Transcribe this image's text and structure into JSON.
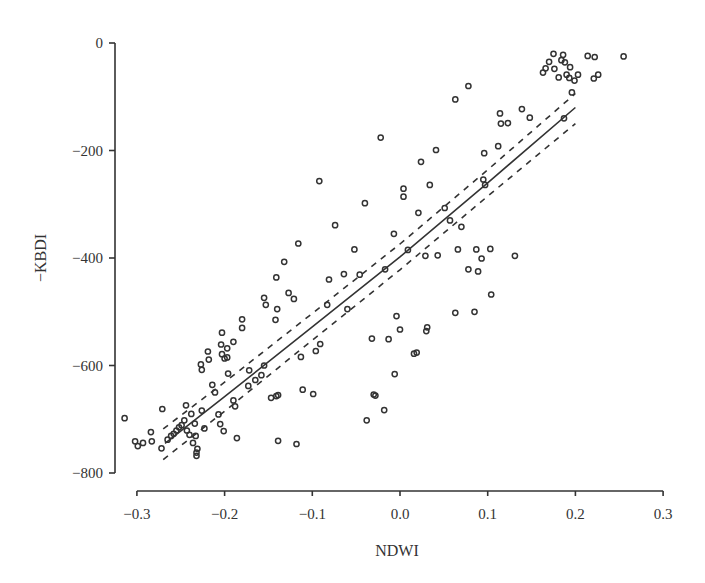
{
  "chart_data": {
    "type": "scatter",
    "title": "",
    "xlabel": "NDWI",
    "ylabel": "−KBDI",
    "xlim": [
      -0.3,
      0.3
    ],
    "ylim": [
      -800,
      0
    ],
    "xticks": [
      "−0.3",
      "−0.2",
      "−0.1",
      "0.0",
      "0.1",
      "0.2",
      "0.3"
    ],
    "xtick_values": [
      -0.3,
      -0.2,
      -0.1,
      0.0,
      0.1,
      0.2,
      0.3
    ],
    "yticks": [
      "0",
      "−200",
      "−400",
      "−600",
      "−800"
    ],
    "ytick_values": [
      0,
      -200,
      -400,
      -600,
      -800
    ],
    "grid": false,
    "legend": null,
    "series": [
      {
        "name": "observations",
        "marker": "open-circle",
        "points": [
          [
            -0.314,
            -698
          ],
          [
            -0.302,
            -741
          ],
          [
            -0.299,
            -750
          ],
          [
            -0.293,
            -744
          ],
          [
            -0.284,
            -724
          ],
          [
            -0.283,
            -741
          ],
          [
            -0.271,
            -681
          ],
          [
            -0.272,
            -754
          ],
          [
            -0.265,
            -738
          ],
          [
            -0.261,
            -731
          ],
          [
            -0.258,
            -727
          ],
          [
            -0.255,
            -721
          ],
          [
            -0.252,
            -715
          ],
          [
            -0.249,
            -711
          ],
          [
            -0.246,
            -702
          ],
          [
            -0.244,
            -674
          ],
          [
            -0.243,
            -721
          ],
          [
            -0.24,
            -729
          ],
          [
            -0.238,
            -690
          ],
          [
            -0.236,
            -744
          ],
          [
            -0.234,
            -708
          ],
          [
            -0.233,
            -731
          ],
          [
            -0.232,
            -762
          ],
          [
            -0.232,
            -768
          ],
          [
            -0.231,
            -755
          ],
          [
            -0.226,
            -684
          ],
          [
            -0.223,
            -717
          ],
          [
            -0.227,
            -598
          ],
          [
            -0.226,
            -608
          ],
          [
            -0.219,
            -574
          ],
          [
            -0.218,
            -589
          ],
          [
            -0.214,
            -636
          ],
          [
            -0.211,
            -650
          ],
          [
            -0.207,
            -691
          ],
          [
            -0.205,
            -709
          ],
          [
            -0.201,
            -722
          ],
          [
            -0.203,
            -539
          ],
          [
            -0.204,
            -561
          ],
          [
            -0.203,
            -579
          ],
          [
            -0.2,
            -587
          ],
          [
            -0.197,
            -568
          ],
          [
            -0.197,
            -585
          ],
          [
            -0.196,
            -615
          ],
          [
            -0.19,
            -556
          ],
          [
            -0.19,
            -665
          ],
          [
            -0.188,
            -676
          ],
          [
            -0.186,
            -735
          ],
          [
            -0.18,
            -514
          ],
          [
            -0.18,
            -530
          ],
          [
            -0.173,
            -638
          ],
          [
            -0.172,
            -609
          ],
          [
            -0.165,
            -627
          ],
          [
            -0.158,
            -618
          ],
          [
            -0.155,
            -600
          ],
          [
            -0.153,
            -487
          ],
          [
            -0.155,
            -474
          ],
          [
            -0.147,
            -660
          ],
          [
            -0.141,
            -657
          ],
          [
            -0.139,
            -655
          ],
          [
            -0.141,
            -436
          ],
          [
            -0.14,
            -495
          ],
          [
            -0.142,
            -515
          ],
          [
            -0.139,
            -740
          ],
          [
            -0.132,
            -407
          ],
          [
            -0.127,
            -465
          ],
          [
            -0.121,
            -476
          ],
          [
            -0.118,
            -746
          ],
          [
            -0.116,
            -373
          ],
          [
            -0.113,
            -584
          ],
          [
            -0.111,
            -645
          ],
          [
            -0.099,
            -653
          ],
          [
            -0.096,
            -573
          ],
          [
            -0.092,
            -257
          ],
          [
            -0.091,
            -560
          ],
          [
            -0.083,
            -487
          ],
          [
            -0.081,
            -440
          ],
          [
            -0.074,
            -339
          ],
          [
            -0.064,
            -430
          ],
          [
            -0.06,
            -495
          ],
          [
            -0.052,
            -384
          ],
          [
            -0.046,
            -431
          ],
          [
            -0.04,
            -298
          ],
          [
            -0.038,
            -702
          ],
          [
            -0.032,
            -550
          ],
          [
            -0.03,
            -654
          ],
          [
            -0.028,
            -656
          ],
          [
            -0.022,
            -176
          ],
          [
            -0.018,
            -683
          ],
          [
            -0.017,
            -421
          ],
          [
            -0.013,
            -551
          ],
          [
            -0.007,
            -355
          ],
          [
            -0.006,
            -616
          ],
          [
            -0.004,
            -508
          ],
          [
            0.0,
            -533
          ],
          [
            0.004,
            -271
          ],
          [
            0.004,
            -286
          ],
          [
            0.009,
            -385
          ],
          [
            0.016,
            -578
          ],
          [
            0.019,
            -576
          ],
          [
            0.021,
            -316
          ],
          [
            0.024,
            -221
          ],
          [
            0.029,
            -396
          ],
          [
            0.03,
            -536
          ],
          [
            0.031,
            -529
          ],
          [
            0.034,
            -264
          ],
          [
            0.041,
            -199
          ],
          [
            0.043,
            -395
          ],
          [
            0.051,
            -307
          ],
          [
            0.057,
            -330
          ],
          [
            0.063,
            -105
          ],
          [
            0.063,
            -502
          ],
          [
            0.066,
            -384
          ],
          [
            0.07,
            -342
          ],
          [
            0.078,
            -80
          ],
          [
            0.078,
            -421
          ],
          [
            0.085,
            -500
          ],
          [
            0.087,
            -384
          ],
          [
            0.089,
            -425
          ],
          [
            0.093,
            -401
          ],
          [
            0.095,
            -254
          ],
          [
            0.096,
            -205
          ],
          [
            0.097,
            -264
          ],
          [
            0.103,
            -383
          ],
          [
            0.104,
            -468
          ],
          [
            0.112,
            -192
          ],
          [
            0.114,
            -131
          ],
          [
            0.115,
            -150
          ],
          [
            0.123,
            -149
          ],
          [
            0.131,
            -396
          ],
          [
            0.139,
            -123
          ],
          [
            0.148,
            -139
          ],
          [
            0.163,
            -55
          ],
          [
            0.166,
            -47
          ],
          [
            0.17,
            -35
          ],
          [
            0.175,
            -20
          ],
          [
            0.176,
            -48
          ],
          [
            0.181,
            -64
          ],
          [
            0.184,
            -32
          ],
          [
            0.186,
            -22
          ],
          [
            0.188,
            -36
          ],
          [
            0.19,
            -59
          ],
          [
            0.193,
            -65
          ],
          [
            0.194,
            -45
          ],
          [
            0.196,
            -92
          ],
          [
            0.199,
            -70
          ],
          [
            0.203,
            -59
          ],
          [
            0.187,
            -140
          ],
          [
            0.214,
            -24
          ],
          [
            0.222,
            -26
          ],
          [
            0.221,
            -66
          ],
          [
            0.226,
            -59
          ],
          [
            0.255,
            -25
          ]
        ]
      },
      {
        "name": "regression fit",
        "style": "solid-line",
        "points": [
          [
            -0.268,
            -745
          ],
          [
            -0.2,
            -658
          ],
          [
            -0.1,
            -528
          ],
          [
            0.0,
            -398
          ],
          [
            0.1,
            -260
          ],
          [
            0.2,
            -120
          ]
        ]
      },
      {
        "name": "upper confidence band",
        "style": "dashed-line",
        "points": [
          [
            -0.27,
            -718
          ],
          [
            -0.2,
            -631
          ],
          [
            -0.1,
            -503
          ],
          [
            0.0,
            -374
          ],
          [
            0.1,
            -236
          ],
          [
            0.2,
            -94
          ]
        ]
      },
      {
        "name": "lower confidence band",
        "style": "dashed-line",
        "points": [
          [
            -0.27,
            -775
          ],
          [
            -0.2,
            -685
          ],
          [
            -0.1,
            -553
          ],
          [
            0.0,
            -422
          ],
          [
            0.1,
            -285
          ],
          [
            0.2,
            -150
          ]
        ]
      }
    ]
  }
}
